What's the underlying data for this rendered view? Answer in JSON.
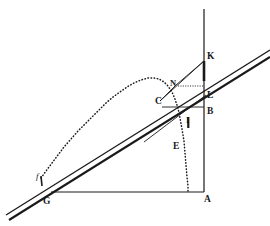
{
  "figure": {
    "title": "",
    "kind": "geometric-diagram",
    "background_color": "#ffffff",
    "ink_color": "#1a1a1a",
    "width": 270,
    "height": 226,
    "labels": [
      {
        "name": "point-label-k",
        "text": "K",
        "x": 207,
        "y": 52
      },
      {
        "name": "point-label-n",
        "text": "N",
        "x": 170,
        "y": 79
      },
      {
        "name": "point-label-l",
        "text": "L",
        "x": 207,
        "y": 91
      },
      {
        "name": "point-label-c",
        "text": "C",
        "x": 155,
        "y": 97
      },
      {
        "name": "point-label-b",
        "text": "B",
        "x": 207,
        "y": 107
      },
      {
        "name": "point-label-i",
        "text": "I",
        "x": 186,
        "y": 116
      },
      {
        "name": "point-label-e",
        "text": "E",
        "x": 173,
        "y": 142
      },
      {
        "name": "point-label-g",
        "text": "G",
        "x": 43,
        "y": 197
      },
      {
        "name": "point-label-a",
        "text": "A",
        "x": 204,
        "y": 195
      },
      {
        "name": "point-label-f",
        "text": "f",
        "x": 36,
        "y": 172
      }
    ],
    "geometry": {
      "vertical_axis": {
        "name": "vertical-axis-line",
        "x1": 204,
        "y1": 9,
        "x2": 204,
        "y2": 192
      },
      "baseline": {
        "name": "baseline-g-a",
        "x1": 51,
        "y1": 192,
        "x2": 204,
        "y2": 192
      },
      "band_upper_line": {
        "name": "inclined-line-upper",
        "x1": 6,
        "y1": 215,
        "x2": 270,
        "y2": 50
      },
      "band_lower_line": {
        "name": "inclined-line-lower",
        "x1": 9,
        "y1": 220,
        "x2": 270,
        "y2": 57
      },
      "thick_segment_k": {
        "name": "thick-segment-kl",
        "x1": 204,
        "y1": 61,
        "x2": 204,
        "y2": 81
      },
      "chord_c_to_k": {
        "name": "chord-c-k",
        "x1": 160,
        "y1": 101,
        "x2": 204,
        "y2": 61
      },
      "chord_c_to_n": {
        "name": "chord-c-n",
        "x1": 160,
        "y1": 101,
        "x2": 176,
        "y2": 85
      },
      "ray_from_n_to_k": {
        "name": "ray-n-k",
        "x1": 176,
        "y1": 85,
        "x2": 204,
        "y2": 61
      },
      "horizontal_c_to_b": {
        "name": "horizontal-c-b",
        "x1": 162,
        "y1": 107,
        "x2": 204,
        "y2": 107
      },
      "dotted_n_horizontal": {
        "name": "dotted-horizontal-n",
        "x1": 178,
        "y1": 86,
        "x2": 204,
        "y2": 86
      },
      "tangent_through_c": {
        "name": "tangent-line-through-c",
        "x1": 144,
        "y1": 142,
        "x2": 206,
        "y2": 95
      },
      "curve_dotted": {
        "name": "dotted-trajectory-curve",
        "points": [
          [
            41,
            178
          ],
          [
            46,
            171
          ],
          [
            52,
            163
          ],
          [
            58,
            155
          ],
          [
            64,
            147
          ],
          [
            71,
            139
          ],
          [
            78,
            131
          ],
          [
            85,
            124
          ],
          [
            92,
            117
          ],
          [
            99,
            110
          ],
          [
            106,
            103
          ],
          [
            113,
            97
          ],
          [
            120,
            92
          ],
          [
            127,
            87
          ],
          [
            134,
            83
          ],
          [
            141,
            80
          ],
          [
            148,
            78
          ],
          [
            154,
            78
          ],
          [
            159,
            79
          ],
          [
            164,
            82
          ],
          [
            168,
            86
          ],
          [
            172,
            92
          ],
          [
            175,
            99
          ],
          [
            178,
            108
          ],
          [
            180,
            118
          ],
          [
            182,
            129
          ],
          [
            184,
            141
          ],
          [
            185,
            153
          ],
          [
            186,
            165
          ],
          [
            187,
            177
          ],
          [
            188,
            186
          ],
          [
            188,
            192
          ]
        ]
      }
    }
  }
}
